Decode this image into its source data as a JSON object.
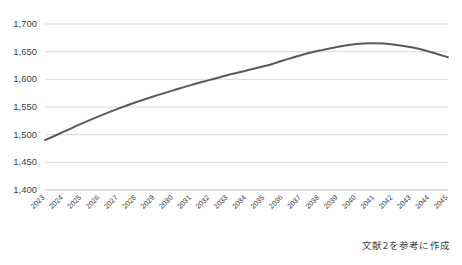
{
  "caption": "文献2を参考に作成",
  "style": {
    "line_color": "#595959",
    "grid_color": "#d9d9d9",
    "axis_color": "#bfbfbf",
    "text_color": "#3f3f3f",
    "background": "#ffffff"
  },
  "chart_data": {
    "type": "line",
    "title": "",
    "xlabel": "",
    "ylabel": "",
    "ylim": [
      1400,
      1700
    ],
    "ytick_step": 50,
    "ytick_labels": [
      "1,700",
      "1,650",
      "1,600",
      "1,550",
      "1,500",
      "1,450",
      "1,400"
    ],
    "ytick_values": [
      1700,
      1650,
      1600,
      1550,
      1500,
      1450,
      1400
    ],
    "grid": "horizontal",
    "legend": "none",
    "categories": [
      "2023",
      "2024",
      "2025",
      "2026",
      "2027",
      "2028",
      "2029",
      "2030",
      "2031",
      "2032",
      "2033",
      "2034",
      "2035",
      "2036",
      "2037",
      "2038",
      "2039",
      "2040",
      "2041",
      "2042",
      "2043",
      "2044",
      "2045"
    ],
    "values": [
      1490,
      1505,
      1520,
      1534,
      1547,
      1559,
      1570,
      1580,
      1590,
      1599,
      1608,
      1616,
      1624,
      1634,
      1644,
      1652,
      1659,
      1664,
      1665,
      1663,
      1658,
      1650,
      1640
    ],
    "annotations": []
  }
}
